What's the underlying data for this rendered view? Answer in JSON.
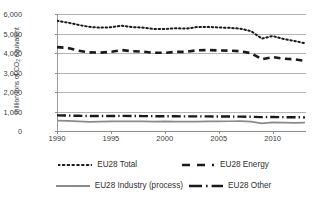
{
  "chart_data": {
    "type": "line",
    "title": "",
    "xlabel": "",
    "ylabel": "million tons of CO2 equivalent",
    "ylabel_html": "million tons of CO<sub>2</sub> equivalent",
    "xlim": [
      1990,
      2013
    ],
    "ylim": [
      0,
      6000
    ],
    "grid": true,
    "legend_position": "bottom",
    "x": [
      1990,
      1991,
      1992,
      1993,
      1994,
      1995,
      1996,
      1997,
      1998,
      1999,
      2000,
      2001,
      2002,
      2003,
      2004,
      2005,
      2006,
      2007,
      2008,
      2009,
      2010,
      2011,
      2012,
      2013
    ],
    "xticks": [
      "1990",
      "1995",
      "2000",
      "2005",
      "2010"
    ],
    "xtick_values": [
      1990,
      1995,
      2000,
      2005,
      2010
    ],
    "yticks": [
      "0",
      "1,000",
      "2,000",
      "3,000",
      "4,000",
      "5,000",
      "6,000"
    ],
    "ytick_values": [
      0,
      1000,
      2000,
      3000,
      4000,
      5000,
      6000
    ],
    "series": [
      {
        "name": "EU28 Total",
        "style": "dotted",
        "color": "#1a1a1a",
        "values": [
          5650,
          5560,
          5440,
          5340,
          5300,
          5320,
          5400,
          5330,
          5300,
          5230,
          5230,
          5270,
          5250,
          5330,
          5340,
          5310,
          5290,
          5250,
          5120,
          4740,
          4870,
          4720,
          4620,
          4500
        ]
      },
      {
        "name": "EU28 Energy",
        "style": "dashed",
        "color": "#1a1a1a",
        "values": [
          4300,
          4260,
          4120,
          4030,
          4020,
          4060,
          4150,
          4090,
          4070,
          4010,
          4010,
          4060,
          4060,
          4140,
          4150,
          4130,
          4120,
          4090,
          3990,
          3680,
          3790,
          3710,
          3680,
          3600
        ]
      },
      {
        "name": "EU28 Industry (process)",
        "style": "solid",
        "color": "#8a8a8a",
        "values": [
          530,
          520,
          490,
          470,
          480,
          490,
          490,
          495,
          495,
          485,
          490,
          480,
          480,
          485,
          495,
          495,
          500,
          505,
          480,
          395,
          440,
          430,
          420,
          430
        ]
      },
      {
        "name": "EU28 Other",
        "style": "dashdot",
        "color": "#1a1a1a",
        "values": [
          800,
          790,
          780,
          770,
          770,
          770,
          775,
          770,
          765,
          760,
          755,
          755,
          750,
          750,
          750,
          745,
          740,
          735,
          730,
          710,
          720,
          710,
          705,
          700
        ]
      }
    ]
  },
  "legend": {
    "items": [
      {
        "label": "EU28 Total",
        "style": "dotted"
      },
      {
        "label": "EU28 Energy",
        "style": "dashed"
      },
      {
        "label": "EU28 Industry (process)",
        "style": "solid"
      },
      {
        "label": "EU28 Other",
        "style": "dashdot"
      }
    ]
  }
}
